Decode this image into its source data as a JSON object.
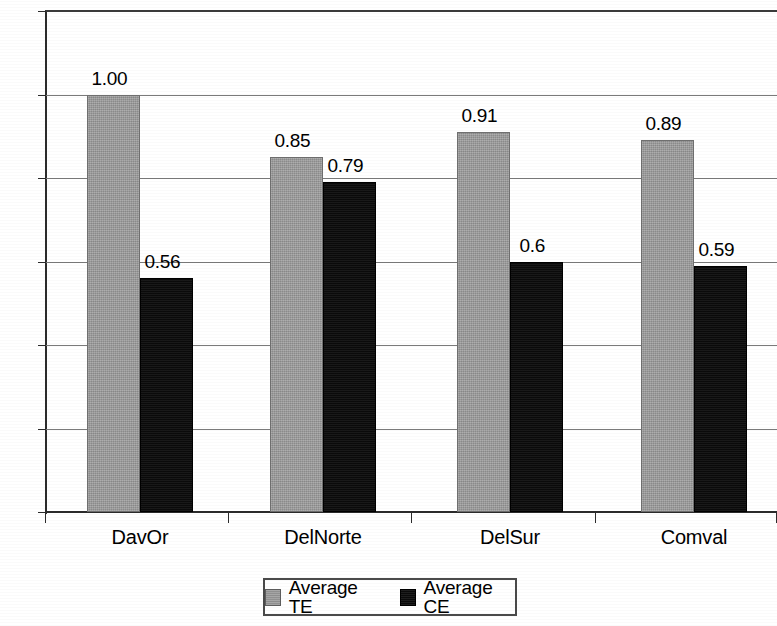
{
  "chart_data": {
    "type": "bar",
    "title": "",
    "xlabel": "",
    "ylabel": "",
    "categories": [
      "DavOr",
      "DelNorte",
      "DelSur",
      "Comval"
    ],
    "series": [
      {
        "name": "Average TE",
        "color": "#9b9b9b",
        "values": [
          1.0,
          0.85,
          0.91,
          0.89
        ],
        "labels": [
          "1.00",
          "0.85",
          "0.91",
          "0.89"
        ]
      },
      {
        "name": "Average CE",
        "color": "#0d0d0d",
        "values": [
          0.56,
          0.79,
          0.6,
          0.59
        ],
        "labels": [
          "0.56",
          "0.79",
          "0.6",
          "0.59"
        ]
      }
    ],
    "ylim": [
      0.0,
      1.2
    ],
    "yticks": [
      0.0,
      0.2,
      0.4,
      0.6,
      0.8,
      1.0,
      1.2
    ],
    "ytick_labels": [
      "0.0",
      "0.2",
      "0.4",
      "0.6",
      "0.8",
      "1.0",
      "1.2"
    ],
    "grid": true,
    "legend_position": "bottom-center"
  },
  "axis": {
    "y_labels": [
      "1.2",
      "1.0",
      "0.8",
      "0.6",
      "0.4",
      "0.2",
      "0.0"
    ],
    "x_labels": [
      "DavOr",
      "DelNorte",
      "DelSur",
      "Comval"
    ]
  },
  "legend": {
    "items": [
      {
        "label": "Average TE",
        "swatch": "gray-square-icon"
      },
      {
        "label": "Average CE",
        "swatch": "black-square-icon"
      }
    ]
  },
  "bar_labels": {
    "te": [
      "1.00",
      "0.85",
      "0.91",
      "0.89"
    ],
    "ce": [
      "0.56",
      "0.79",
      "0.6",
      "0.59"
    ]
  }
}
